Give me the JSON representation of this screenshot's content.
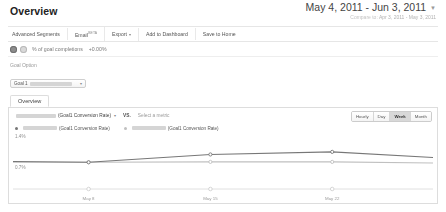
{
  "header": {
    "title": "Overview",
    "date_range": "May 4, 2011 - Jun 3, 2011",
    "compare_label": "Compare to:",
    "compare_range": "Apr 3, 2011 - May 3, 2011",
    "caret": "▼"
  },
  "toolbar": {
    "items": [
      {
        "label": "Advanced Segments",
        "badge": "",
        "caret": ""
      },
      {
        "label": "Email",
        "badge": "BETA",
        "caret": ""
      },
      {
        "label": "Export",
        "badge": "",
        "caret": "▾"
      },
      {
        "label": "Add to Dashboard",
        "badge": "",
        "caret": ""
      },
      {
        "label": "Save to Home",
        "badge": "",
        "caret": ""
      }
    ]
  },
  "metric_summary": {
    "metric_label": "% of goal completions",
    "delta": "+0.00%"
  },
  "goal_option": {
    "label": "Goal Option",
    "selected_prefix": "Goal 1",
    "caret": "▾"
  },
  "panel": {
    "tab_label": "Overview",
    "selector": {
      "metric_suffix": "(Goal1 Conversion Rate)",
      "caret": "▾",
      "vs": "VS.",
      "select_metric_placeholder": "Select a metric"
    },
    "granularity": {
      "options": [
        "Hourly",
        "Day",
        "Week",
        "Month"
      ],
      "selected": "Week"
    },
    "legend": [
      {
        "suffix": "(Goal1 Conversion Rate)",
        "color": "#777777"
      },
      {
        "suffix": "(Goal1 Conversion Rate)",
        "color": "#c0c0c0"
      }
    ]
  },
  "chart_data": {
    "type": "line",
    "title": "",
    "xlabel": "",
    "ylabel": "",
    "grid": false,
    "legend_position": "top",
    "ylim": [
      0,
      1.4
    ],
    "yticks": [
      1.4,
      0.7
    ],
    "ytick_labels": [
      "1.4%",
      "0.7%"
    ],
    "x": [
      "May 8",
      "May 15",
      "May 22"
    ],
    "xtick_labels": [
      "May 8",
      "May 15",
      "May 22"
    ],
    "xtick_positions_pct": [
      18,
      47,
      76
    ],
    "series": [
      {
        "name": "(Goal1 Conversion Rate)",
        "color": "#777777",
        "points_pct": [
          {
            "x": 0,
            "y": 0.74
          },
          {
            "x": 18,
            "y": 0.72
          },
          {
            "x": 47,
            "y": 0.93
          },
          {
            "x": 76,
            "y": 1.0
          },
          {
            "x": 100,
            "y": 0.85
          }
        ],
        "markers_pct": [
          18,
          47,
          76
        ]
      },
      {
        "name": "(Goal1 Conversion Rate)",
        "color": "#c0c0c0",
        "points_pct": [
          {
            "x": 0,
            "y": 0.72
          },
          {
            "x": 18,
            "y": 0.72
          },
          {
            "x": 47,
            "y": 0.73
          },
          {
            "x": 76,
            "y": 0.73
          },
          {
            "x": 100,
            "y": 0.7
          }
        ],
        "markers_pct": [
          18,
          47,
          76
        ]
      }
    ]
  },
  "colors": {
    "series1": "#777777",
    "series2": "#c0c0c0",
    "text": "#444444",
    "muted": "#9a9a9a",
    "border": "#dddddd"
  }
}
